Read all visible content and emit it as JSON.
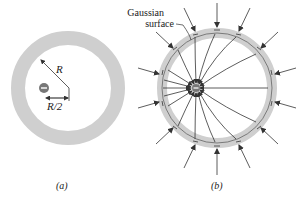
{
  "panel_a": {
    "caption": "(a)",
    "radius_label": "R",
    "offset_label": "R/2",
    "charge_sign": "−"
  },
  "panel_b": {
    "caption": "(b)",
    "gaussian_label_line1": "Gaussian",
    "gaussian_label_line2": "surface",
    "charge_sign": "−"
  },
  "colors": {
    "shell": "#cfcfcf",
    "line": "#333333",
    "charge": "#777777",
    "background": "#ffffff"
  }
}
